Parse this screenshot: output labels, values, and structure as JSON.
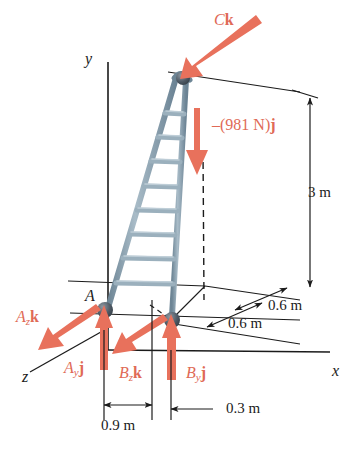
{
  "figure": {
    "colors": {
      "force_red": "#e8715c",
      "force_text_red": "#e06a56",
      "ladder_rail": "#8fa6b5",
      "ladder_rail_dark": "#5d7585",
      "ladder_rung": "#9bb0bd",
      "joint_dark": "#4a5560",
      "line_black": "#1b1b1b",
      "background": "#ffffff"
    }
  },
  "axes": {
    "y_label": "y",
    "x_label": "x",
    "z_label": "z"
  },
  "points": {
    "A": "A"
  },
  "forces": [
    {
      "name": "reaction-C",
      "label_main": "C",
      "label_vector": "k",
      "color": "#e06a56"
    },
    {
      "name": "weight",
      "label": "–(981 N)",
      "label_vector": "j",
      "magnitude": "981",
      "unit": "N",
      "color": "#e06a56"
    },
    {
      "name": "reaction-Az",
      "label_main": "A",
      "label_sub": "z",
      "label_vector": "k",
      "color": "#e06a56"
    },
    {
      "name": "reaction-Ay",
      "label_main": "A",
      "label_sub": "y",
      "label_vector": "j",
      "color": "#e06a56"
    },
    {
      "name": "reaction-Bz",
      "label_main": "B",
      "label_sub": "z",
      "label_vector": "k",
      "color": "#e06a56"
    },
    {
      "name": "reaction-By",
      "label_main": "B",
      "label_sub": "y",
      "label_vector": "j",
      "color": "#e06a56"
    }
  ],
  "dimensions": [
    {
      "name": "height",
      "value": "3 m"
    },
    {
      "name": "depth-upper",
      "value": "0.6 m"
    },
    {
      "name": "depth-lower",
      "value": "0.6 m"
    },
    {
      "name": "base-width",
      "value": "0.9 m"
    },
    {
      "name": "offset-right",
      "value": "0.3 m"
    }
  ]
}
